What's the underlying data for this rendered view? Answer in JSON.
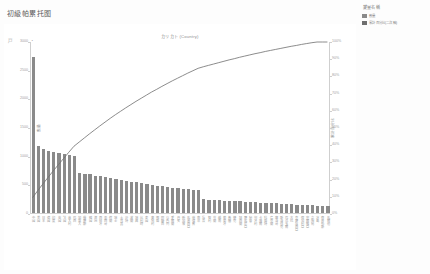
{
  "page": {
    "title": "初級帕累托图"
  },
  "chart_header": {
    "corner_mark": "戸",
    "corner_mark_2": "・",
    "subtitle": "カリカト (Country)"
  },
  "legend": {
    "title": "變量名稱",
    "items": [
      {
        "label": "數量",
        "color": "#8a8a8a"
      },
      {
        "label": "累計 百分比(二次 軸)",
        "color": "#6f6f6f"
      }
    ]
  },
  "chart_data": {
    "type": "bar",
    "title": "初級帕累托图",
    "subtitle": "カリカト (Country)",
    "xlabel": "",
    "ylabel": "數量",
    "y2label": "累計百分比",
    "ylim": [
      0,
      3000
    ],
    "y2lim": [
      0,
      100
    ],
    "grid": false,
    "legend_position": "right",
    "yticks": [
      0,
      500,
      1000,
      1500,
      2000,
      2500,
      3000
    ],
    "yticklabels": [
      "0",
      "500",
      "1000",
      "1500",
      "2000",
      "2500",
      "3000"
    ],
    "y2ticks": [
      0,
      10,
      20,
      30,
      40,
      50,
      60,
      70,
      80,
      90,
      100
    ],
    "y2ticklabels": [
      "0%",
      "10%",
      "20%",
      "30%",
      "40%",
      "50%",
      "60%",
      "70%",
      "80%",
      "90%",
      "100%"
    ],
    "categories": [
      "中國",
      "美國",
      "日本",
      "德國",
      "印度",
      "英國",
      "法國",
      "意大利",
      "巴西",
      "加拿大",
      "俄羅斯",
      "韓國",
      "澳洲",
      "西班牙",
      "墨西哥",
      "荷蘭",
      "瑞士",
      "土耳其",
      "沙特",
      "波蘭",
      "瑞典",
      "比利時",
      "泰國",
      "奧地利",
      "挪威",
      "阿聯酋",
      "以色列",
      "愛爾蘭",
      "丹麥",
      "新加坡",
      "馬來西亞",
      "菲律賓",
      "南非",
      "埃及",
      "智利",
      "芬蘭",
      "越南",
      "葡萄牙",
      "希臘",
      "捷克",
      "紐西蘭",
      "羅馬尼亞",
      "秘魯",
      "匈牙利",
      "卡塔爾",
      "科威特",
      "烏克蘭",
      "摩洛哥",
      "斯洛伐克",
      "厄瓜多爾",
      "古巴",
      "克羅埃西亞",
      "保加利亞",
      "塞爾維亞",
      "立陶宛",
      "冰島",
      "賽普勒斯",
      "馬爾他"
    ],
    "series": [
      {
        "name": "數量",
        "type": "bar",
        "color": "#8a8a8a",
        "values": [
          2720,
          1180,
          1120,
          1090,
          1070,
          1050,
          1035,
          1020,
          1000,
          700,
          690,
          680,
          660,
          650,
          640,
          620,
          600,
          580,
          560,
          550,
          540,
          530,
          520,
          500,
          480,
          470,
          460,
          450,
          440,
          430,
          420,
          410,
          400,
          250,
          240,
          235,
          230,
          225,
          220,
          215,
          210,
          205,
          200,
          195,
          190,
          185,
          180,
          175,
          170,
          165,
          160,
          155,
          150,
          145,
          140,
          135,
          130,
          125
        ]
      },
      {
        "name": "累計 百分比(二次 軸)",
        "type": "line",
        "color": "#6f6f6f",
        "values": [
          9.5,
          13.6,
          17.5,
          21.3,
          25.1,
          28.7,
          32.3,
          35.9,
          39.4,
          41.8,
          44.2,
          46.6,
          48.9,
          51.2,
          53.4,
          55.6,
          57.7,
          59.7,
          61.7,
          63.6,
          65.5,
          67.3,
          69.1,
          70.9,
          72.5,
          74.2,
          75.8,
          77.4,
          78.9,
          80.4,
          81.9,
          83.3,
          84.7,
          85.6,
          86.4,
          87.2,
          88.0,
          88.8,
          89.6,
          90.3,
          91.1,
          91.8,
          92.5,
          93.2,
          93.8,
          94.5,
          95.1,
          95.7,
          96.3,
          96.9,
          97.5,
          98.0,
          98.6,
          99.1,
          99.6,
          100.0,
          100.0,
          100.0
        ]
      }
    ]
  }
}
